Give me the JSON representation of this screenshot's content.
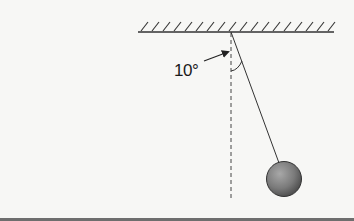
{
  "diagram": {
    "type": "pendulum",
    "angle_label": "10°",
    "angle_degrees": 10,
    "elements": {
      "ceiling": "hatched-ceiling",
      "string": "pendulum-string",
      "bob": "pendulum-bob",
      "reference_line": "vertical-dashed-line",
      "angle_arc": "angle-arc",
      "arrow": "angle-pointer-arrow"
    },
    "colors": {
      "background": "#f7f7f5",
      "line": "#333333",
      "bob_fill": "#7a7a7a",
      "bob_highlight": "#a8a8a8",
      "bob_shadow": "#4a4a4a"
    }
  }
}
